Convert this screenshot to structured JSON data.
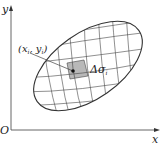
{
  "diagram": {
    "axes": {
      "x_label": "x",
      "y_label": "y",
      "origin_label": "O"
    },
    "region": {
      "shape": "ellipse",
      "grid": "curvilinear",
      "fill": "#ffffff",
      "stroke": "#333333"
    },
    "sub_region": {
      "label": "Δσ",
      "label_subscript": "i",
      "fill": "#b8b8b8"
    },
    "point": {
      "label": "(x",
      "label_sub1": "i",
      "label_mid": ", y",
      "label_sub2": "i",
      "label_end": ")"
    }
  }
}
